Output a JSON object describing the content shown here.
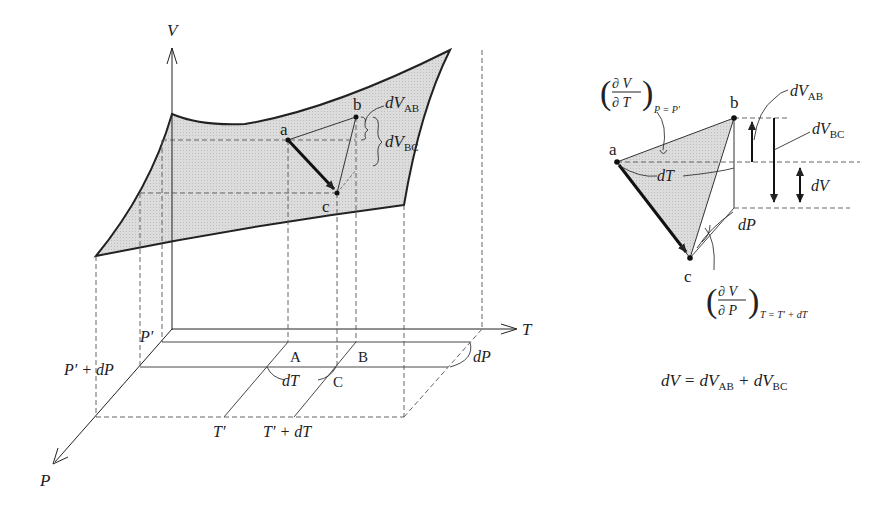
{
  "left_diagram": {
    "axes": {
      "v": "V",
      "t": "T",
      "p": "P"
    },
    "surface_points": {
      "a": "a",
      "b": "b",
      "c": "c"
    },
    "base_points": {
      "A": "A",
      "B": "B",
      "C": "C"
    },
    "labels": {
      "dV_AB_d": "dV",
      "dV_AB_sub": "AB",
      "dV_BC_d": "dV",
      "dV_BC_sub": "BC",
      "p_prime": "P′",
      "p_prime_dp": "P′ + dP",
      "t_prime": "T′",
      "t_prime_dt": "T′ + dT",
      "dT": "dT",
      "dP": "dP"
    }
  },
  "right_diagram": {
    "points": {
      "a": "a",
      "b": "b",
      "c": "c"
    },
    "partial_T": {
      "num": "∂ V",
      "den": "∂ T",
      "cond": "P = P′"
    },
    "partial_P": {
      "num": "∂ V",
      "den": "∂ P",
      "cond": "T = T′ + dT"
    },
    "labels": {
      "dV_AB_d": "dV",
      "dV_AB_sub": "AB",
      "dV_BC_d": "dV",
      "dV_BC_sub": "BC",
      "dV": "dV",
      "dT": "dT",
      "dP": "dP"
    },
    "equation": {
      "lhs": "dV = dV",
      "sub1": "AB",
      "mid": " + dV",
      "sub2": "BC"
    }
  },
  "colors": {
    "surface_fill": "#d9d9d9",
    "line": "#222222",
    "dash": "#555555"
  }
}
